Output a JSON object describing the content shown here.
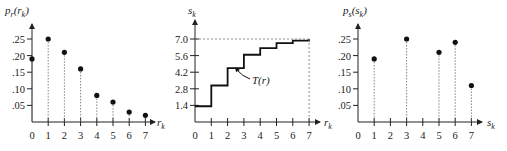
{
  "chart_data": [
    {
      "type": "scatter",
      "title": "",
      "ylabel": "p_r(r_k)",
      "xlabel": "r_k",
      "x": [
        0,
        1,
        2,
        3,
        4,
        5,
        6,
        7
      ],
      "values": [
        0.19,
        0.25,
        0.21,
        0.16,
        0.08,
        0.06,
        0.03,
        0.02
      ],
      "yticks": [
        ".05",
        ".10",
        ".15",
        ".20",
        ".25"
      ],
      "xticks": [
        "0",
        "1",
        "2",
        "3",
        "4",
        "5",
        "6",
        "7"
      ],
      "ylim": [
        0,
        0.28
      ],
      "stems": "dashed",
      "grid": false
    },
    {
      "type": "line",
      "style": "step",
      "title": "",
      "ylabel": "s_k",
      "xlabel": "r_k",
      "annotation": "T(r)",
      "x": [
        0,
        1,
        2,
        3,
        4,
        5,
        6,
        7
      ],
      "values": [
        1.33,
        3.08,
        4.55,
        5.67,
        6.23,
        6.65,
        6.86,
        7.0
      ],
      "yticks": [
        "1.4",
        "2.8",
        "4.2",
        "5.6",
        "7.0"
      ],
      "xticks": [
        "0",
        "1",
        "2",
        "3",
        "4",
        "5",
        "6",
        "7"
      ],
      "ylim": [
        0,
        7.5
      ],
      "grid": false
    },
    {
      "type": "scatter",
      "title": "",
      "ylabel": "p_s(s_k)",
      "xlabel": "s_k",
      "x": [
        1,
        3,
        5,
        6,
        7
      ],
      "values": [
        0.19,
        0.25,
        0.21,
        0.24,
        0.11
      ],
      "yticks": [
        ".05",
        ".10",
        ".15",
        ".20",
        ".25"
      ],
      "xticks": [
        "0",
        "1",
        "2",
        "3",
        "4",
        "5",
        "6",
        "7"
      ],
      "ylim": [
        0,
        0.28
      ],
      "stems": "dashed",
      "grid": false
    }
  ],
  "labels": {
    "left_y_main": "p",
    "left_y_sub": "r",
    "left_y_arg": "(r",
    "left_y_arg_sub": "k",
    "left_y_close": ")",
    "mid_y_main": "s",
    "mid_y_sub": "k",
    "right_y_main": "p",
    "right_y_sub": "s",
    "right_y_arg": "(s",
    "right_y_arg_sub": "k",
    "right_y_close": ")",
    "left_x_main": "r",
    "left_x_sub": "k",
    "mid_x_main": "r",
    "mid_x_sub": "k",
    "right_x_main": "s",
    "right_x_sub": "k",
    "annotation": "T(r)"
  }
}
